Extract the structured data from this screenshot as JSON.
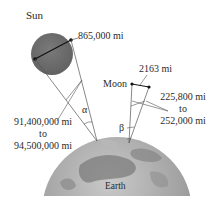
{
  "diagram": {
    "sun": {
      "label": "Sun",
      "diameter_label": "865,000 mi",
      "color": "#6e6e6e"
    },
    "sun_distance": {
      "line1": "91,400,000 mi",
      "line2": "to",
      "line3": "94,500,000 mi"
    },
    "alpha_label": "α",
    "moon": {
      "label": "Moon",
      "diameter_label": "2163 mi"
    },
    "moon_distance": {
      "line1": "225,800 mi",
      "line2": "to",
      "line3": "252,000 mi"
    },
    "beta_label": "β",
    "earth": {
      "label": "Earth",
      "color": "#9a9a9a"
    }
  }
}
